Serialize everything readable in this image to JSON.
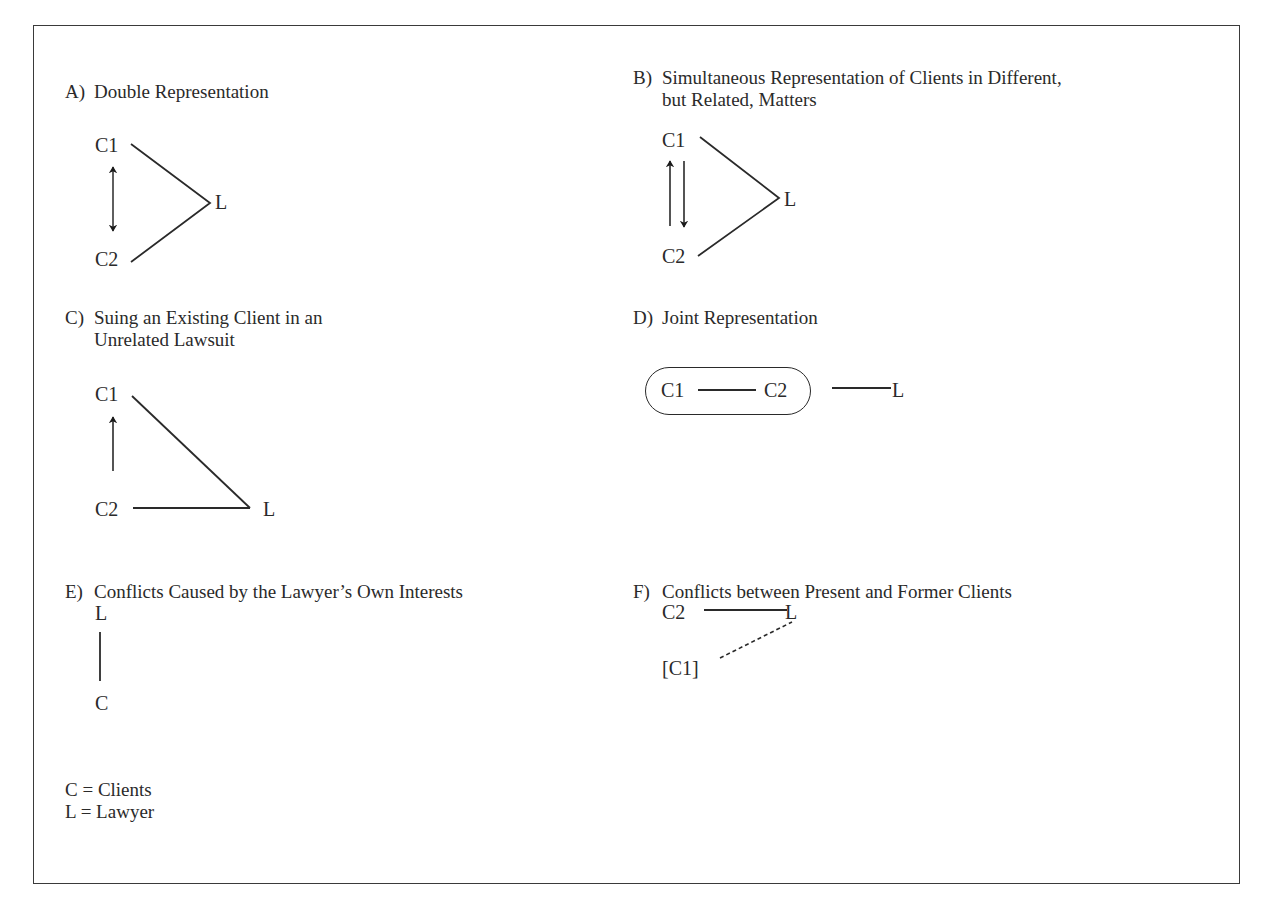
{
  "panels": {
    "A": {
      "letter": "A)",
      "title_line1": "Double Representation",
      "nodes": {
        "c1": "C1",
        "c2": "C2",
        "l": "L"
      },
      "relation": "bidirectional arrow between C1 and C2"
    },
    "B": {
      "letter": "B)",
      "title_line1": "Simultaneous Representation of Clients in Different,",
      "title_line2": "but Related, Matters",
      "nodes": {
        "c1": "C1",
        "c2": "C2",
        "l": "L"
      },
      "relation": "separate up and down arrows between C1 and C2"
    },
    "C": {
      "letter": "C)",
      "title_line1": "Suing an Existing Client in an",
      "title_line2": "Unrelated Lawsuit",
      "nodes": {
        "c1": "C1",
        "c2": "C2",
        "l": "L"
      },
      "relation": "arrow from C2 up to C1"
    },
    "D": {
      "letter": "D)",
      "title_line1": "Joint Representation",
      "nodes": {
        "c1": "C1",
        "c2": "C2",
        "l": "L"
      },
      "relation": "C1 and C2 grouped in a rounded enclosure, linked to L"
    },
    "E": {
      "letter": "E)",
      "title_line1": "Conflicts Caused by the Lawyer’s Own Interests",
      "nodes": {
        "l": "L",
        "c": "C"
      },
      "relation": "vertical line between L and C"
    },
    "F": {
      "letter": "F)",
      "title_line1": "Conflicts between Present and Former Clients",
      "nodes": {
        "c2": "C2",
        "l": "L",
        "c1": "[C1]"
      },
      "relation": "solid line C2–L, dashed line L–[C1]"
    }
  },
  "legend": {
    "items": [
      "C = Clients",
      "L = Lawyer"
    ]
  },
  "colors": {
    "ink": "#2a2a2a",
    "frame": "#3a3a3a",
    "background": "#ffffff"
  }
}
